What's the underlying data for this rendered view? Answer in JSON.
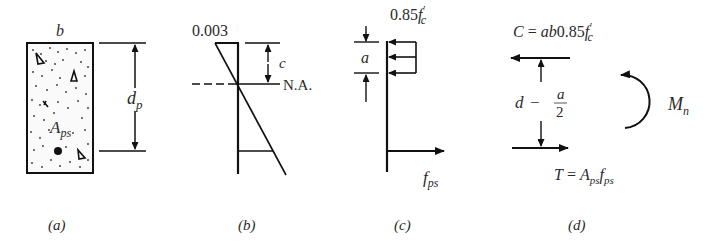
{
  "figure": {
    "panels": [
      {
        "id": "a",
        "caption": "(a)",
        "description": "Beam cross-section with prestressing steel",
        "labels": {
          "width": "b",
          "depth_main": "d",
          "depth_sub": "p",
          "steel_main": "A",
          "steel_sub": "ps"
        }
      },
      {
        "id": "b",
        "caption": "(b)",
        "description": "Strain distribution",
        "labels": {
          "strain": "0.003",
          "na_depth": "c",
          "neutral_axis": "N.A."
        }
      },
      {
        "id": "c",
        "caption": "(c)",
        "description": "Equivalent stress block",
        "labels": {
          "stress_prefix": "0.85",
          "stress_main": "f",
          "stress_prime": "′",
          "stress_sub": "c",
          "block_depth": "a",
          "steel_stress_main": "f",
          "steel_stress_sub": "ps"
        }
      },
      {
        "id": "d",
        "caption": "(d)",
        "description": "Internal forces and nominal moment",
        "labels": {
          "compression_lhs": "C",
          "compression_eq": " = ",
          "compression_rhs_a": "ab",
          "compression_rhs_num": "0.85",
          "compression_rhs_f": "f",
          "compression_rhs_prime": "′",
          "compression_rhs_sub": "c",
          "lever_d": "d",
          "lever_minus": "−",
          "lever_num": "a",
          "lever_den": "2",
          "tension_lhs": "T",
          "tension_eq": " = ",
          "tension_A": "A",
          "tension_A_sub": "ps",
          "tension_f": "f",
          "tension_f_sub": "ps",
          "moment_main": "M",
          "moment_sub": "n"
        }
      }
    ]
  }
}
